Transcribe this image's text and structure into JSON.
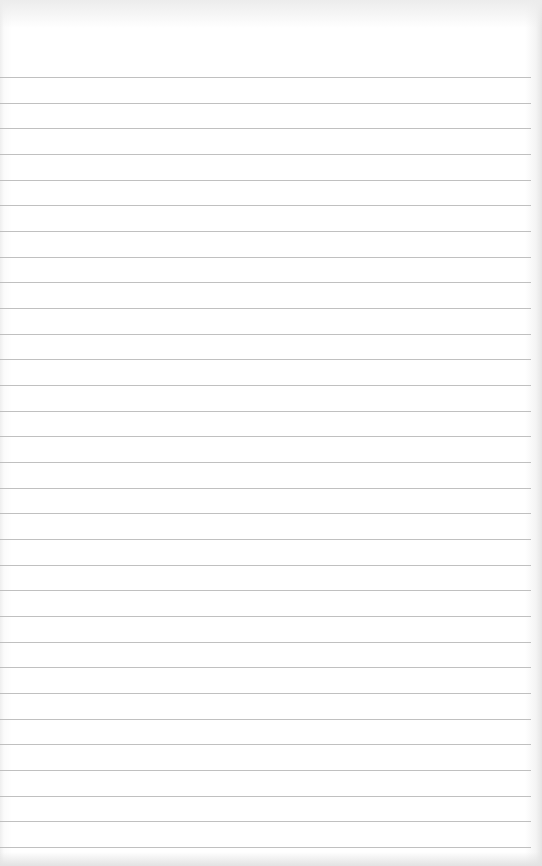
{
  "page": {
    "type": "lined-paper",
    "background_color": "#ffffff",
    "line_color": "#b5b5b5",
    "line_count": 31,
    "first_line_y": 77,
    "line_spacing": 25.67
  }
}
